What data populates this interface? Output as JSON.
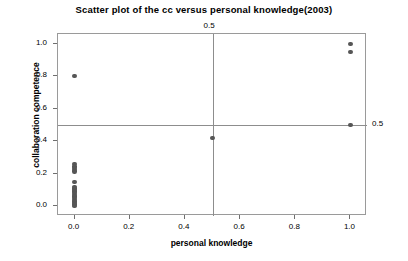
{
  "chart_data": {
    "type": "scatter",
    "title": "Scatter plot of the cc versus personal knowledge(2003)",
    "xlabel": "personal knowledge",
    "ylabel": "collaboration competence",
    "xlim": [
      -0.06,
      1.06
    ],
    "ylim": [
      -0.06,
      1.06
    ],
    "grid": false,
    "legend": null,
    "xticks": [
      0.0,
      0.2,
      0.4,
      0.6,
      0.8,
      1.0
    ],
    "xticklabels": [
      "0.0",
      "0.2",
      "0.4",
      "0.6",
      "0.8",
      "1.0"
    ],
    "yticks": [
      0.0,
      0.2,
      0.4,
      0.6,
      0.8,
      1.0
    ],
    "yticklabels": [
      "0.0",
      "0.2",
      "0.4",
      "0.6",
      "0.8",
      "1.0"
    ],
    "reference_lines": [
      {
        "orientation": "vertical",
        "value": 0.5,
        "label": "0.5",
        "label_position": "top"
      },
      {
        "orientation": "horizontal",
        "value": 0.5,
        "label": "0.5",
        "label_position": "right"
      }
    ],
    "marker_color": "#565656",
    "points": [
      {
        "x": 0.0,
        "y": 0.8
      },
      {
        "x": 0.0,
        "y": 0.26
      },
      {
        "x": 0.0,
        "y": 0.245
      },
      {
        "x": 0.0,
        "y": 0.235
      },
      {
        "x": 0.0,
        "y": 0.225
      },
      {
        "x": 0.0,
        "y": 0.215
      },
      {
        "x": 0.0,
        "y": 0.15
      },
      {
        "x": 0.0,
        "y": 0.12
      },
      {
        "x": 0.0,
        "y": 0.11
      },
      {
        "x": 0.0,
        "y": 0.1
      },
      {
        "x": 0.0,
        "y": 0.09
      },
      {
        "x": 0.0,
        "y": 0.08
      },
      {
        "x": 0.0,
        "y": 0.07
      },
      {
        "x": 0.0,
        "y": 0.06
      },
      {
        "x": 0.0,
        "y": 0.05
      },
      {
        "x": 0.0,
        "y": 0.04
      },
      {
        "x": 0.0,
        "y": 0.03
      },
      {
        "x": 0.0,
        "y": 0.02
      },
      {
        "x": 0.0,
        "y": 0.01
      },
      {
        "x": 0.0,
        "y": 0.0
      },
      {
        "x": 0.5,
        "y": 0.42
      },
      {
        "x": 1.0,
        "y": 1.0
      },
      {
        "x": 1.0,
        "y": 0.95
      },
      {
        "x": 1.0,
        "y": 0.5
      }
    ]
  }
}
